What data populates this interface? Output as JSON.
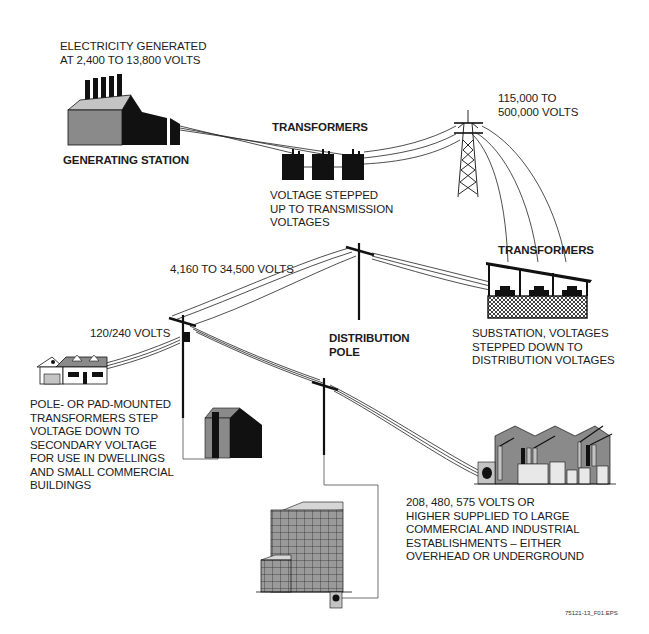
{
  "diagram": {
    "labels": {
      "generation_note": [
        "ELECTRICITY GENERATED",
        "AT 2,400 TO 13,800 VOLTS"
      ],
      "generating_station": "GENERATING STATION",
      "step_up_transformers": "TRANSFORMERS",
      "step_up_note": [
        "VOLTAGE STEPPED",
        "UP TO TRANSMISSION",
        "VOLTAGES"
      ],
      "transmission_voltage": [
        "115,000 TO",
        "500,000 VOLTS"
      ],
      "substation_transformers": "TRANSFORMERS",
      "substation_note": [
        "SUBSTATION, VOLTAGES",
        "STEPPED DOWN TO",
        "DISTRIBUTION VOLTAGES"
      ],
      "distribution_voltage": "4,160 TO 34,500 VOLTS",
      "distribution_pole": [
        "DISTRIBUTION",
        "POLE"
      ],
      "residential_voltage": "120/240 VOLTS",
      "pole_transformer_note": [
        "POLE- OR PAD-MOUNTED",
        "TRANSFORMERS STEP",
        "VOLTAGE DOWN TO",
        "SECONDARY VOLTAGE",
        "FOR USE IN DWELLINGS",
        "AND SMALL COMMERCIAL",
        "BUILDINGS"
      ],
      "industrial_note": [
        "208, 480, 575 VOLTS OR",
        "HIGHER SUPPLIED TO LARGE",
        "COMMERCIAL AND INDUSTRIAL",
        "ESTABLISHMENTS – EITHER",
        "OVERHEAD OR UNDERGROUND"
      ]
    },
    "figure_id": "75121-13_F01.EPS",
    "colors": {
      "ink": "#111111",
      "gray_fill": "#8a8a8a",
      "light_gray": "#c4c4c4",
      "background": "#ffffff"
    }
  }
}
